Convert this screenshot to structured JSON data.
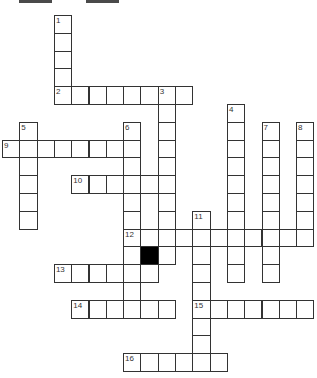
{
  "header_bars": [
    {
      "name": "top-bar-left",
      "x": 19,
      "width": 33
    },
    {
      "name": "top-bar-right",
      "x": 86,
      "width": 33
    }
  ],
  "grid": {
    "origin_x": 2,
    "origin_y": 15,
    "cell_w": 17.3,
    "cell_h": 17.8,
    "black_cells": [
      [
        13,
        8
      ]
    ]
  },
  "clues": {
    "across": [
      {
        "number": "2",
        "row": 4,
        "col": 3,
        "length": 8
      },
      {
        "number": "9",
        "row": 7,
        "col": 0,
        "length": 8
      },
      {
        "number": "10",
        "row": 9,
        "col": 4,
        "length": 6
      },
      {
        "number": "12",
        "row": 12,
        "col": 7,
        "length": 11
      },
      {
        "number": "13",
        "row": 14,
        "col": 3,
        "length": 6
      },
      {
        "number": "14",
        "row": 16,
        "col": 4,
        "length": 6
      },
      {
        "number": "15",
        "row": 16,
        "col": 11,
        "length": 7
      },
      {
        "number": "16",
        "row": 19,
        "col": 7,
        "length": 6
      }
    ],
    "down": [
      {
        "number": "1",
        "row": 0,
        "col": 3,
        "length": 5
      },
      {
        "number": "3",
        "row": 4,
        "col": 9,
        "length": 10
      },
      {
        "number": "4",
        "row": 5,
        "col": 13,
        "length": 10
      },
      {
        "number": "5",
        "row": 6,
        "col": 1,
        "length": 6
      },
      {
        "number": "6",
        "row": 6,
        "col": 7,
        "length": 11
      },
      {
        "number": "7",
        "row": 6,
        "col": 15,
        "length": 9
      },
      {
        "number": "8",
        "row": 6,
        "col": 17,
        "length": 7
      },
      {
        "number": "11",
        "row": 11,
        "col": 11,
        "length": 9
      }
    ]
  },
  "colors": {
    "cell_border": "#333333",
    "black_cell": "#000000",
    "top_bar": "#4a4a4a",
    "background": "#ffffff"
  }
}
